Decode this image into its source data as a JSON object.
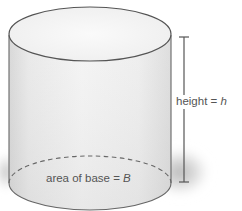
{
  "diagram": {
    "type": "cylinder",
    "labels": {
      "height": {
        "text": "height = ",
        "variable": "h"
      },
      "base": {
        "text": "area of base = ",
        "variable": "B"
      }
    },
    "colors": {
      "outline": "#555555",
      "side_fill_light": "#f2f2f2",
      "side_fill_dark": "#d6d6d6",
      "top_fill": "#f4f4f4",
      "shadow": "#bdbdbd",
      "label_text": "#555555"
    }
  }
}
